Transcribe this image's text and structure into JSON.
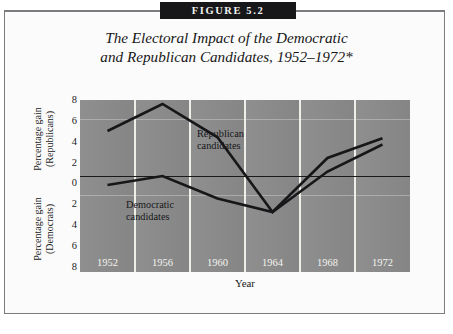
{
  "figure": {
    "banner_label": "FIGURE 5.2",
    "title_line_1": "The Electoral Impact of the Democratic",
    "title_line_2": "and Republican Candidates, 1952–1972*",
    "footnote": ""
  },
  "chart_data": {
    "type": "line",
    "title": "The Electoral Impact of the Democratic and Republican Candidates, 1952–1972*",
    "xlabel": "Year",
    "ylabel_upper": "Percentage gain (Republicans)",
    "ylabel_lower": "Percentage gain (Democrats)",
    "categories": [
      "1952",
      "1956",
      "1960",
      "1964",
      "1968",
      "1972"
    ],
    "x": [
      1952,
      1956,
      1960,
      1964,
      1968,
      1972
    ],
    "ylim": [
      -8,
      8
    ],
    "yticks_upper": [
      "8",
      "6",
      "4",
      "2",
      "0"
    ],
    "yticks_lower": [
      "2",
      "4",
      "6",
      "8"
    ],
    "yticks_signed": [
      8,
      6,
      4,
      2,
      0,
      -2,
      -4,
      -6,
      -8
    ],
    "grid": true,
    "grid_orientation": "vertical",
    "zero_line": true,
    "legend": "inline-annotations",
    "series": [
      {
        "name": "Republican candidates",
        "label_line_1": "Republican",
        "label_line_2": "candidates",
        "values": [
          5.0,
          8.0,
          4.3,
          -4.0,
          2.0,
          4.2
        ]
      },
      {
        "name": "Democratic candidates",
        "label_line_1": "Democratic",
        "label_line_2": "candidates",
        "values": [
          -1.0,
          0.0,
          -2.5,
          -4.0,
          0.5,
          3.5
        ]
      }
    ]
  },
  "axes": {
    "upper_title_l1": "Percentage gain",
    "upper_title_l2": "(Republicans)",
    "lower_title_l1": "Percentage gain",
    "lower_title_l2": "(Democrats)",
    "x_title": "Year"
  },
  "colors": {
    "plot_background": "#8a8a8a",
    "gridline": "#efefea",
    "series_line": "#17171a",
    "zero_line": "#1a1a1a",
    "banner_background": "#17171a",
    "banner_text": "#f2f2ef",
    "frame_border": "#7c7c80",
    "xtick_text": "#f4f4ef"
  }
}
